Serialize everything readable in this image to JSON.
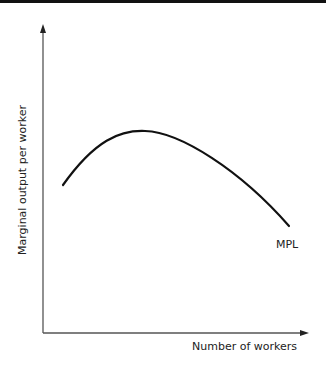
{
  "diagram": {
    "type": "economics-curve",
    "axes": {
      "x_label": "Number of workers",
      "y_label": "Marginal output per worker"
    },
    "curves": [
      {
        "name": "MPL",
        "label": "MPL",
        "shape": "inverted-U",
        "color": "#111111"
      }
    ]
  }
}
